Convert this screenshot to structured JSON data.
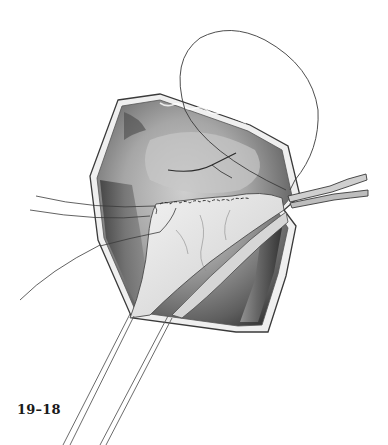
{
  "figure": {
    "label": "19–18",
    "colors": {
      "background": "#ffffff",
      "outline": "#3a3a3a",
      "cavity_dark": "#4a4a4a",
      "cavity_mid": "#9a9a9a",
      "tissue_light": "#e2e2e2",
      "label": "#1a1a1a"
    }
  }
}
